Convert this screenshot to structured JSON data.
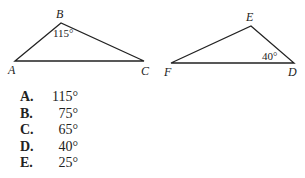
{
  "figure": {
    "triangle_abc": {
      "vertices": {
        "A": [
          15,
          61
        ],
        "B": [
          61,
          23
        ],
        "C": [
          144,
          61
        ]
      },
      "labels": {
        "A": "A",
        "B": "B",
        "C": "C"
      },
      "angle_B": "115°"
    },
    "triangle_def": {
      "vertices": {
        "F": [
          171,
          63
        ],
        "E": [
          251,
          26
        ],
        "D": [
          294,
          63
        ]
      },
      "labels": {
        "D": "D",
        "E": "E",
        "F": "F"
      },
      "angle_D": "40°"
    }
  },
  "choices": [
    {
      "letter": "A.",
      "value": "115°"
    },
    {
      "letter": "B.",
      "value": "75°"
    },
    {
      "letter": "C.",
      "value": "65°"
    },
    {
      "letter": "D.",
      "value": "40°"
    },
    {
      "letter": "E.",
      "value": "25°"
    }
  ]
}
